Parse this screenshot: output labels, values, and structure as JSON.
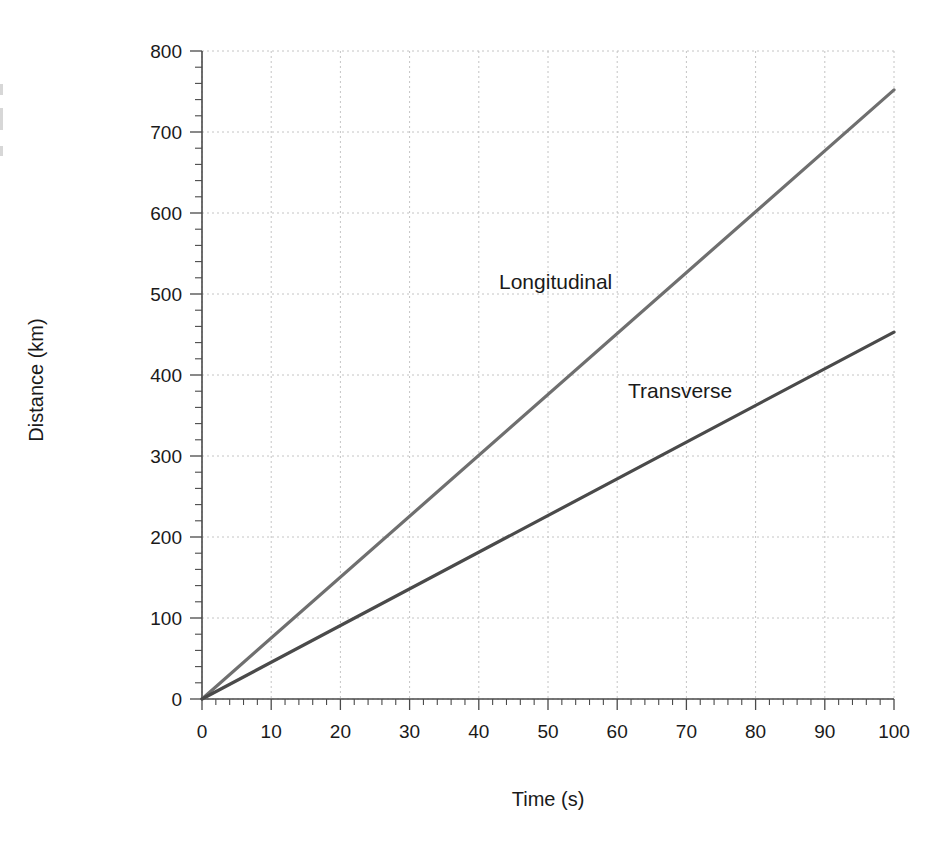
{
  "chart_data": {
    "type": "line",
    "title": "",
    "xlabel": "Time (s)",
    "ylabel": "Distance (km)",
    "xlim": [
      0,
      100
    ],
    "ylim": [
      0,
      800
    ],
    "xticks": [
      0,
      10,
      20,
      30,
      40,
      50,
      60,
      70,
      80,
      90,
      100
    ],
    "yticks": [
      0,
      100,
      200,
      300,
      400,
      500,
      600,
      700,
      800
    ],
    "xtick_labels": [
      "0",
      "10",
      "20",
      "30",
      "40",
      "50",
      "60",
      "70",
      "80",
      "90",
      "100"
    ],
    "ytick_labels": [
      "0",
      "100",
      "200",
      "300",
      "400",
      "500",
      "600",
      "700",
      "800"
    ],
    "x_minor_step": 2,
    "y_minor_step": 20,
    "grid": true,
    "grid_style": "dotted",
    "grid_color": "#c4c4c4",
    "legend": "inline-annotations",
    "series": [
      {
        "name": "Longitudinal",
        "color": "#6f6f6f",
        "slope_km_per_s": 7.52,
        "x": [
          0,
          100
        ],
        "values": [
          0,
          752
        ],
        "label_x": 30,
        "label_y": 516
      },
      {
        "name": "Transverse",
        "color": "#4a4a4a",
        "slope_km_per_s": 4.53,
        "x": [
          0,
          100
        ],
        "values": [
          0,
          453
        ],
        "label_x": 49,
        "label_y": 381
      }
    ],
    "annotations": [
      {
        "text": "Longitudinal",
        "x": 30,
        "y": 516
      },
      {
        "text": "Transverse",
        "x": 49,
        "y": 381
      }
    ]
  },
  "axes": {
    "spine_color": "#4a4a4a",
    "tick_color": "#4a4a4a",
    "background": "#ffffff"
  }
}
